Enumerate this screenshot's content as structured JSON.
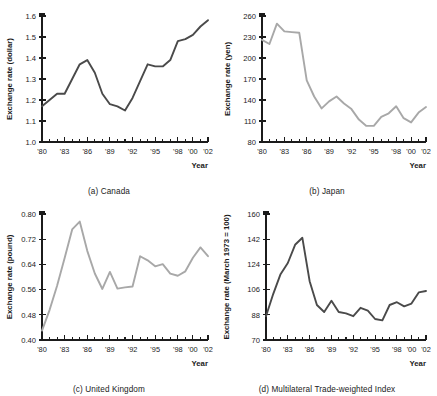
{
  "figure": {
    "xlabel": "Year",
    "x_tick_labels_all": [
      "'80",
      "'81",
      "'82",
      "'83",
      "'84",
      "'85",
      "'86",
      "'87",
      "'88",
      "'89",
      "'90",
      "'91",
      "'92",
      "'93",
      "'94",
      "'95",
      "'96",
      "'97",
      "'98",
      "'99",
      "'00",
      "'01",
      "'02"
    ],
    "x_labeled": [
      "'80",
      "'83",
      "'86",
      "'89",
      "'92",
      "'95",
      "'98",
      "'00",
      "'02"
    ],
    "colors": {
      "dark_line": "#4a4a4a",
      "light_line": "#a8a8a8",
      "axis": "#1b1b1b",
      "background": "#ffffff"
    }
  },
  "chart_data": [
    {
      "id": "canada",
      "type": "line",
      "title": "(a) Canada",
      "caption": "(a) Canada",
      "xlabel": "Year",
      "ylabel": "Exchange rate (dollar)",
      "ylim": [
        1.0,
        1.6
      ],
      "yticks": [
        1.0,
        1.1,
        1.2,
        1.3,
        1.4,
        1.5,
        1.6
      ],
      "ytick_labels": [
        "1.0",
        "1.1",
        "1.2",
        "1.3",
        "1.4",
        "1.5",
        "1.6"
      ],
      "grid": false,
      "legend": "none",
      "line_color": "#4a4a4a",
      "x": [
        1980,
        1981,
        1982,
        1983,
        1984,
        1985,
        1986,
        1987,
        1988,
        1989,
        1990,
        1991,
        1992,
        1993,
        1994,
        1995,
        1996,
        1997,
        1998,
        1999,
        2000,
        2001,
        2002
      ],
      "categories": [
        "'80",
        "'81",
        "'82",
        "'83",
        "'84",
        "'85",
        "'86",
        "'87",
        "'88",
        "'89",
        "'90",
        "'91",
        "'92",
        "'93",
        "'94",
        "'95",
        "'96",
        "'97",
        "'98",
        "'99",
        "'00",
        "'01",
        "'02"
      ],
      "values": [
        1.17,
        1.2,
        1.23,
        1.23,
        1.3,
        1.37,
        1.39,
        1.33,
        1.23,
        1.18,
        1.17,
        1.15,
        1.21,
        1.29,
        1.37,
        1.36,
        1.36,
        1.39,
        1.48,
        1.49,
        1.51,
        1.55,
        1.58
      ]
    },
    {
      "id": "japan",
      "type": "line",
      "title": "(b) Japan",
      "caption": "(b) Japan",
      "xlabel": "Year",
      "ylabel": "Exchange rate (yen)",
      "ylim": [
        80,
        260
      ],
      "yticks": [
        80,
        110,
        140,
        170,
        200,
        230,
        260
      ],
      "ytick_labels": [
        "80",
        "110",
        "140",
        "170",
        "200",
        "230",
        "260"
      ],
      "grid": false,
      "legend": "none",
      "line_color": "#a8a8a8",
      "x": [
        1980,
        1981,
        1982,
        1983,
        1984,
        1985,
        1986,
        1987,
        1988,
        1989,
        1990,
        1991,
        1992,
        1993,
        1994,
        1995,
        1996,
        1997,
        1998,
        1999,
        2000,
        2001,
        2002
      ],
      "categories": [
        "'80",
        "'81",
        "'82",
        "'83",
        "'84",
        "'85",
        "'86",
        "'87",
        "'88",
        "'89",
        "'90",
        "'91",
        "'92",
        "'93",
        "'94",
        "'95",
        "'96",
        "'97",
        "'98",
        "'99",
        "'00",
        "'01",
        "'02"
      ],
      "values": [
        226,
        220,
        249,
        238,
        237,
        236,
        168,
        145,
        128,
        138,
        145,
        135,
        127,
        112,
        103,
        103,
        116,
        121,
        131,
        114,
        108,
        122,
        130
      ]
    },
    {
      "id": "united-kingdom",
      "type": "line",
      "title": "(c) United Kingdom",
      "caption": "(c) United Kingdom",
      "xlabel": "Year",
      "ylabel": "Exchange rate (pound)",
      "ylim": [
        0.4,
        0.8
      ],
      "yticks": [
        0.4,
        0.48,
        0.56,
        0.64,
        0.72,
        0.8
      ],
      "ytick_labels": [
        "0.40",
        "0.48",
        "0.56",
        "0.64",
        "0.72",
        "0.80"
      ],
      "grid": false,
      "legend": "none",
      "line_color": "#a8a8a8",
      "x": [
        1980,
        1981,
        1982,
        1983,
        1984,
        1985,
        1986,
        1987,
        1988,
        1989,
        1990,
        1991,
        1992,
        1993,
        1994,
        1995,
        1996,
        1997,
        1998,
        1999,
        2000,
        2001,
        2002
      ],
      "categories": [
        "'80",
        "'81",
        "'82",
        "'83",
        "'84",
        "'85",
        "'86",
        "'87",
        "'88",
        "'89",
        "'90",
        "'91",
        "'92",
        "'93",
        "'94",
        "'95",
        "'96",
        "'97",
        "'98",
        "'99",
        "'00",
        "'01",
        "'02"
      ],
      "values": [
        0.43,
        0.495,
        0.572,
        0.66,
        0.751,
        0.776,
        0.683,
        0.611,
        0.562,
        0.616,
        0.563,
        0.567,
        0.57,
        0.666,
        0.653,
        0.634,
        0.641,
        0.611,
        0.604,
        0.618,
        0.661,
        0.694,
        0.666
      ]
    },
    {
      "id": "multilateral-trade-weighted-index",
      "type": "line",
      "title": "(d) Multilateral Trade-weighted Index",
      "caption": "(d) Multilateral Trade-weighted Index",
      "xlabel": "Year",
      "ylabel": "Exchange rate (March 1973 = 100)",
      "ylim": [
        70,
        160
      ],
      "yticks": [
        70,
        88,
        106,
        124,
        142,
        160
      ],
      "ytick_labels": [
        "70",
        "88",
        "106",
        "124",
        "142",
        "160"
      ],
      "grid": false,
      "legend": "none",
      "line_color": "#4a4a4a",
      "x": [
        1980,
        1981,
        1982,
        1983,
        1984,
        1985,
        1986,
        1987,
        1988,
        1989,
        1990,
        1991,
        1992,
        1993,
        1994,
        1995,
        1996,
        1997,
        1998,
        1999,
        2000,
        2001,
        2002
      ],
      "categories": [
        "'80",
        "'81",
        "'82",
        "'83",
        "'84",
        "'85",
        "'86",
        "'87",
        "'88",
        "'89",
        "'90",
        "'91",
        "'92",
        "'93",
        "'94",
        "'95",
        "'96",
        "'97",
        "'98",
        "'99",
        "'00",
        "'01",
        "'02"
      ],
      "values": [
        87,
        103,
        117,
        125,
        138,
        143,
        112,
        95,
        90,
        98,
        90,
        89,
        87,
        93,
        91,
        85,
        84,
        95,
        97,
        94,
        96,
        104,
        105
      ]
    }
  ]
}
